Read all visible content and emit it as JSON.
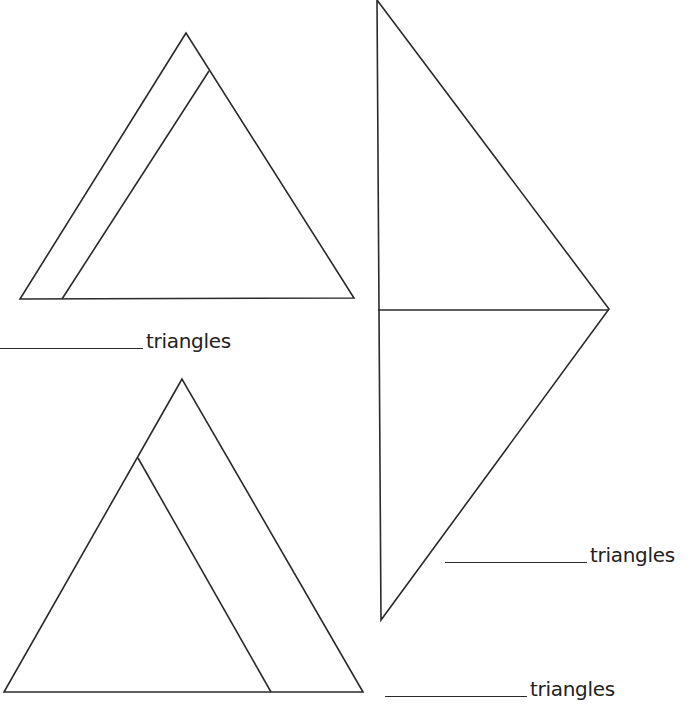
{
  "worksheet": {
    "header_fragment": "... y ... g ... p",
    "figures": [
      {
        "id": "figure-1",
        "description": "triangle divided by one line",
        "outer": [
          [
            186,
            33
          ],
          [
            20,
            299
          ],
          [
            354,
            298
          ]
        ],
        "divider": [
          [
            209,
            71
          ],
          [
            62,
            299
          ]
        ]
      },
      {
        "id": "figure-2",
        "description": "kite divided by horizontal line",
        "outer": [
          [
            377,
            0
          ],
          [
            609,
            309
          ],
          [
            381,
            620
          ]
        ],
        "vertical_edge": [
          [
            377,
            0
          ],
          [
            381,
            620
          ]
        ],
        "divider": [
          [
            378,
            310
          ],
          [
            609,
            310
          ]
        ]
      },
      {
        "id": "figure-3",
        "description": "triangle divided by one line",
        "outer": [
          [
            182,
            379
          ],
          [
            4,
            692
          ],
          [
            363,
            692
          ]
        ],
        "divider": [
          [
            138,
            458
          ],
          [
            271,
            692
          ]
        ]
      }
    ],
    "answers": [
      {
        "blank": "",
        "label": "triangles"
      },
      {
        "blank": "",
        "label": "triangles"
      },
      {
        "blank": "",
        "label": "triangles"
      }
    ]
  },
  "colors": {
    "ink": "#2a2a2a",
    "paper": "#ffffff"
  }
}
